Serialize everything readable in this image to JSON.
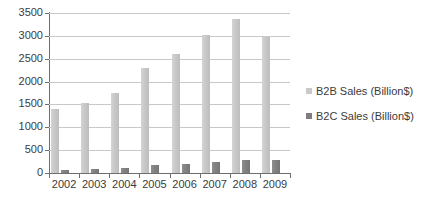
{
  "chart_data": {
    "type": "bar",
    "title": "",
    "xlabel": "",
    "ylabel": "",
    "categories": [
      "2002",
      "2003",
      "2004",
      "2005",
      "2006",
      "2007",
      "2008",
      "2009"
    ],
    "series": [
      {
        "name": "B2B Sales (Billion$)",
        "color": "#c9c9c9",
        "values": [
          1390,
          1530,
          1760,
          2300,
          2610,
          3020,
          3370,
          2980
        ]
      },
      {
        "name": "B2C Sales (Billion$)",
        "color": "#7d7d7d",
        "values": [
          75,
          95,
          115,
          180,
          205,
          245,
          285,
          285
        ]
      }
    ],
    "ylim": [
      0,
      3500
    ],
    "yticks": [
      0,
      500,
      1000,
      1500,
      2000,
      2500,
      3000,
      3500
    ],
    "ytick_labels": [
      "0",
      "500",
      "1000",
      "1500",
      "2000",
      "2500",
      "3000",
      "3500"
    ],
    "grid": true,
    "legend_position": "right"
  },
  "legend": {
    "items": [
      {
        "label": "B2B Sales (Billion$)",
        "swatch": "#c9c9c9"
      },
      {
        "label": "B2C Sales (Billion$)",
        "swatch": "#7d7d7d"
      }
    ]
  },
  "colors": {
    "background": "#ffffff",
    "axis": "#6e6e6e",
    "gridline": "#c8c8c8",
    "text": "#3b3b3b"
  }
}
